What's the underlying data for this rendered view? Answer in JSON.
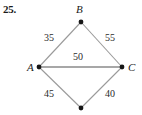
{
  "problem": {
    "number": "25."
  },
  "diagram": {
    "type": "weighted-graph",
    "colors": {
      "diagonal_edge": "#9a9a9a",
      "horizontal_edge": "#8a8a8a",
      "vertex": "#161616",
      "text": "#1a1a1a"
    },
    "vertices": [
      {
        "id": "B",
        "label": "B",
        "x": 81,
        "y": 22,
        "label_x": 76,
        "label_y": 4
      },
      {
        "id": "A",
        "label": "A",
        "x": 39,
        "y": 67,
        "label_x": 27,
        "label_y": 62
      },
      {
        "id": "C",
        "label": "C",
        "x": 122,
        "y": 67,
        "label_x": 128,
        "label_y": 62
      },
      {
        "id": "D",
        "label": "",
        "x": 81,
        "y": 108,
        "label_x": 0,
        "label_y": 0
      }
    ],
    "edges": [
      {
        "from": "A",
        "to": "B",
        "weight": "35",
        "label_x": 44,
        "label_y": 33,
        "style": "diagonal"
      },
      {
        "from": "B",
        "to": "C",
        "weight": "55",
        "label_x": 105,
        "label_y": 33,
        "style": "diagonal"
      },
      {
        "from": "A",
        "to": "C",
        "weight": "50",
        "label_x": 73,
        "label_y": 52,
        "style": "horizontal"
      },
      {
        "from": "A",
        "to": "D",
        "weight": "45",
        "label_x": 44,
        "label_y": 89,
        "style": "diagonal"
      },
      {
        "from": "D",
        "to": "C",
        "weight": "40",
        "label_x": 105,
        "label_y": 89,
        "style": "diagonal"
      }
    ]
  }
}
